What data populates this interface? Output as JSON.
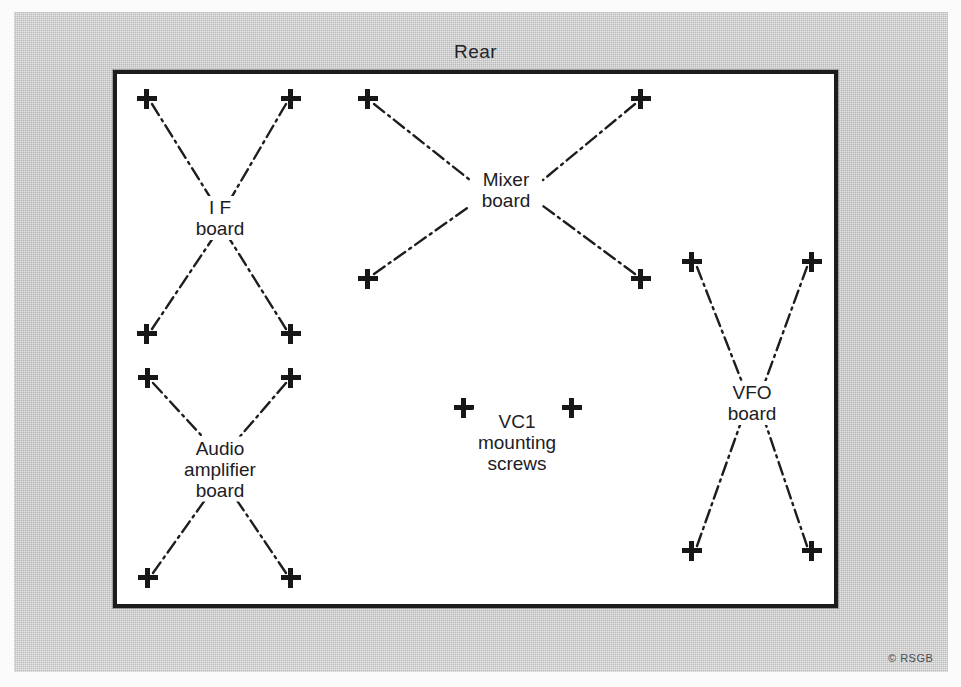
{
  "figure": {
    "orientation_label": "Rear",
    "credit": "© RSGB",
    "chassis": {
      "border_color": "#1c1c1c",
      "fill_color": "#ffffff"
    },
    "background_color": "#c9c9c9",
    "ink_color": "#1d1d1d"
  },
  "boards": [
    {
      "id": "if-board",
      "name": "I F board",
      "label_lines": [
        "I F",
        "board"
      ],
      "label_x": 220,
      "label_y": 218,
      "screw_holes": [
        {
          "x": 147,
          "y": 99
        },
        {
          "x": 291,
          "y": 99
        },
        {
          "x": 147,
          "y": 334
        },
        {
          "x": 291,
          "y": 334
        }
      ]
    },
    {
      "id": "mixer-board",
      "name": "Mixer board",
      "label_lines": [
        "Mixer",
        "board"
      ],
      "label_x": 506,
      "label_y": 190,
      "screw_holes": [
        {
          "x": 368,
          "y": 99
        },
        {
          "x": 641,
          "y": 99
        },
        {
          "x": 368,
          "y": 279
        },
        {
          "x": 641,
          "y": 279
        }
      ]
    },
    {
      "id": "audio-amplifier-board",
      "name": "Audio amplifier board",
      "label_lines": [
        "Audio",
        "amplifier",
        "board"
      ],
      "label_x": 220,
      "label_y": 469,
      "screw_holes": [
        {
          "x": 148,
          "y": 378
        },
        {
          "x": 291,
          "y": 378
        },
        {
          "x": 148,
          "y": 578
        },
        {
          "x": 291,
          "y": 578
        }
      ]
    },
    {
      "id": "vfo-board",
      "name": "VFO board",
      "label_lines": [
        "VFO",
        "board"
      ],
      "label_x": 752,
      "label_y": 403,
      "screw_holes": [
        {
          "x": 692,
          "y": 262
        },
        {
          "x": 812,
          "y": 262
        },
        {
          "x": 692,
          "y": 551
        },
        {
          "x": 812,
          "y": 551
        }
      ]
    }
  ],
  "annotations": [
    {
      "id": "vc1-mounting-screws",
      "name": "VC1 mounting screws",
      "label_lines": [
        "VC1",
        "mounting",
        "screws"
      ],
      "label_x": 517,
      "label_y": 442,
      "screw_holes": [
        {
          "x": 464,
          "y": 408
        },
        {
          "x": 572,
          "y": 408
        }
      ]
    }
  ],
  "leader_lines": [
    {
      "board": "if-board",
      "d": "M 152 104 L 215 205"
    },
    {
      "board": "if-board",
      "d": "M 286 104 L 227 205"
    },
    {
      "board": "if-board",
      "d": "M 152 329 L 213 238"
    },
    {
      "board": "if-board",
      "d": "M 286 329 L 229 238"
    },
    {
      "board": "mixer-board",
      "d": "M 374 104 L 470 180"
    },
    {
      "board": "mixer-board",
      "d": "M 635 104 L 543 180"
    },
    {
      "board": "mixer-board",
      "d": "M 374 274 L 470 206"
    },
    {
      "board": "mixer-board",
      "d": "M 635 274 L 543 206"
    },
    {
      "board": "audio-amplifier-board",
      "d": "M 153 383 L 212 447"
    },
    {
      "board": "audio-amplifier-board",
      "d": "M 286 383 L 231 447"
    },
    {
      "board": "audio-amplifier-board",
      "d": "M 153 573 L 210 493"
    },
    {
      "board": "audio-amplifier-board",
      "d": "M 286 573 L 232 493"
    },
    {
      "board": "vfo-board",
      "d": "M 697 267 L 742 382"
    },
    {
      "board": "vfo-board",
      "d": "M 807 267 L 765 382"
    },
    {
      "board": "vfo-board",
      "d": "M 697 546 L 740 425"
    },
    {
      "board": "vfo-board",
      "d": "M 807 546 L 766 425"
    }
  ]
}
